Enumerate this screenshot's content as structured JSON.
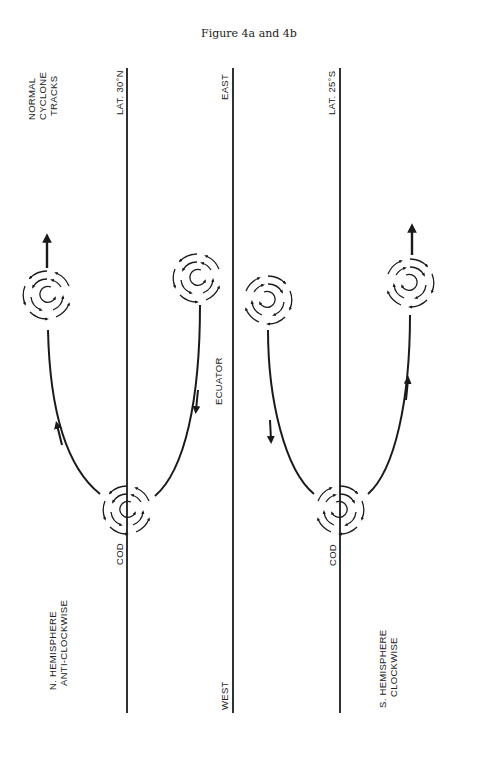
{
  "figure": {
    "title": "Figure 4a and 4b"
  },
  "lines": {
    "lat_north": "LAT. 30°N",
    "equator": "ECUATOR",
    "lat_south": "LAT. 25°S"
  },
  "labels": {
    "normal_tracks": [
      "NORMAL",
      "CYCLONE",
      "TRACKS"
    ],
    "east": "EAST",
    "west": "WEST",
    "cod_north": "COD",
    "cod_south": "COD",
    "north_hemisphere": [
      "N. HEMISPHERE",
      "ANTI-CLOCKWISE"
    ],
    "south_hemisphere": [
      "S. HEMISPHERE",
      "CLOCKWISE"
    ]
  },
  "panels": [
    {
      "id": "4a",
      "hemisphere": "North",
      "rotation": "anti-clockwise",
      "origin": "COD",
      "tracks": [
        "recurving to top-left with arrow",
        "moving toward equator"
      ]
    },
    {
      "id": "4b",
      "hemisphere": "South",
      "rotation": "clockwise",
      "origin": "COD",
      "tracks": [
        "moving toward equator",
        "recurving to top-right with arrow"
      ]
    }
  ],
  "colors": {
    "ink": "#1a1a1a",
    "paper": "#ffffff"
  }
}
